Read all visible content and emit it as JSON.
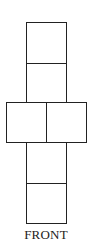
{
  "diagram": {
    "type": "cube-net",
    "label": "FRONT",
    "stroke_color": "#222222",
    "background_color": "#ffffff",
    "cells": [
      {
        "id": "top-1",
        "row": 1,
        "col": 2
      },
      {
        "id": "top-2",
        "row": 2,
        "col": 2
      },
      {
        "id": "middle-left",
        "row": 3,
        "col": 1
      },
      {
        "id": "middle-right",
        "row": 3,
        "col": 2
      },
      {
        "id": "bottom-1",
        "row": 4,
        "col": 2
      },
      {
        "id": "bottom-2",
        "row": 5,
        "col": 2
      }
    ]
  }
}
